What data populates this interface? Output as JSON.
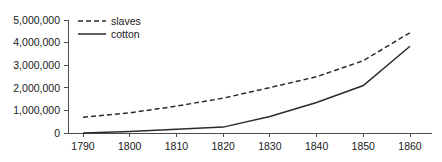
{
  "chart_data": {
    "type": "line",
    "title": "",
    "subtitle": "",
    "xlabel": "",
    "ylabel": "",
    "x": [
      1790,
      1800,
      1810,
      1820,
      1830,
      1840,
      1850,
      1860
    ],
    "xtick_labels": [
      "1790",
      "1800",
      "1810",
      "1820",
      "1830",
      "1840",
      "1850",
      "1860"
    ],
    "ytick_labels": [
      "0",
      "1,000,000",
      "2,000,000",
      "3,000,000",
      "4,000,000",
      "5,000,000"
    ],
    "ytick_values": [
      0,
      1000000,
      2000000,
      3000000,
      4000000,
      5000000
    ],
    "xlim": [
      1785,
      1865
    ],
    "ylim": [
      0,
      5000000
    ],
    "grid": false,
    "legend_position": "top-left",
    "series": [
      {
        "name": "slaves",
        "style": "dashed",
        "color": "#2b2b2b",
        "values": [
          700000,
          890000,
          1190000,
          1540000,
          2010000,
          2490000,
          3200000,
          4440000
        ]
      },
      {
        "name": "cotton",
        "style": "solid",
        "color": "#2b2b2b",
        "values": [
          5000,
          70000,
          170000,
          260000,
          730000,
          1350000,
          2100000,
          3840000
        ]
      }
    ]
  },
  "legend": {
    "items": [
      {
        "label": "slaves",
        "style": "dashed"
      },
      {
        "label": "cotton",
        "style": "solid"
      }
    ]
  },
  "axes": {
    "x_axis_name": "year-axis",
    "y_axis_name": "count-axis"
  }
}
